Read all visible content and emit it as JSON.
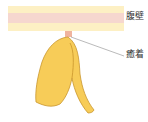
{
  "labels": {
    "abdominal_wall": "腹壁",
    "adhesion": "癒着"
  },
  "colors": {
    "wall_outer": "#fdf0c4",
    "wall_inner": "#f6d7cf",
    "organ_fill": "#f7cc58",
    "organ_stroke": "#c9962c",
    "adhesion_point": "#f0b49e",
    "leader_line": "#8c8c8c"
  }
}
